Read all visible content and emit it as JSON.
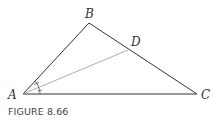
{
  "figure": {
    "caption": "FIGURE 8.66",
    "vertices": [
      {
        "name": "A",
        "x": 23,
        "y": 94,
        "label_x": 8,
        "label_y": 99
      },
      {
        "name": "B",
        "x": 89,
        "y": 23,
        "label_x": 85,
        "label_y": 18
      },
      {
        "name": "C",
        "x": 197,
        "y": 94,
        "label_x": 201,
        "label_y": 99
      },
      {
        "name": "D",
        "x": 128,
        "y": 50,
        "label_x": 131,
        "label_y": 46
      }
    ],
    "segments": [
      {
        "from": "A",
        "to": "B",
        "style": "solid"
      },
      {
        "from": "B",
        "to": "C",
        "style": "solid"
      },
      {
        "from": "A",
        "to": "C",
        "style": "solid"
      },
      {
        "from": "A",
        "to": "D",
        "style": "light"
      }
    ],
    "annotations": {
      "angle_bisector": "AD bisects angle A (two equal angle marks)"
    },
    "colors": {
      "line": "#333333",
      "bisector": "#999999",
      "arc": "#555555"
    }
  }
}
